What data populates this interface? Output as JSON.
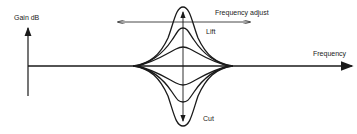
{
  "diagram": {
    "type": "equalizer-response",
    "labels": {
      "y_axis": "Gain dB",
      "x_axis": "Frequency",
      "frequency_adjust": "Frequency adjust",
      "lift": "Lift",
      "cut": "Cut"
    },
    "baseline_y": 66,
    "center_x": 183,
    "curves": {
      "lift_peaks_y": [
        7,
        28,
        47
      ],
      "cut_troughs_y": [
        85,
        102,
        126
      ],
      "converge_left_x": 135,
      "converge_right_x": 231
    },
    "colors": {
      "stroke": "#1a1a1a",
      "background": "#ffffff"
    }
  }
}
